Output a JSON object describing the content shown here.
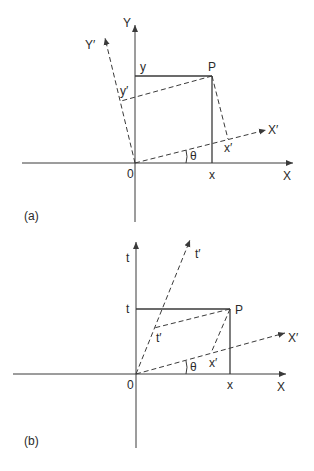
{
  "figure": {
    "panel_a": {
      "tag": "(a)",
      "labels": {
        "x_axis": "X",
        "y_axis": "Y",
        "x_prime_axis": "X′",
        "y_prime_axis": "Y′",
        "origin": "0",
        "point": "P",
        "x_coord": "x",
        "y_coord": "y",
        "x_prime_coord": "x′",
        "y_prime_coord": "y′",
        "angle": "θ"
      }
    },
    "panel_b": {
      "tag": "(b)",
      "labels": {
        "x_axis": "X",
        "t_axis": "t",
        "x_prime_axis": "X′",
        "t_prime_axis": "t′",
        "origin": "0",
        "point": "P",
        "x_coord": "x",
        "t_coord": "t",
        "x_prime_coord": "x′",
        "t_prime_coord": "t′",
        "angle": "θ"
      }
    },
    "colors": {
      "line": "#3a3a3a",
      "text": "#2a2a2a",
      "background": "#ffffff"
    }
  }
}
